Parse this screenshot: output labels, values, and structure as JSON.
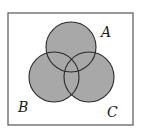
{
  "diagram": {
    "type": "venn",
    "title": "",
    "universe": {
      "x": 8,
      "y": 13,
      "width": 125,
      "height": 112,
      "stroke": "#555555"
    },
    "style": {
      "fill": "#a8a8a8",
      "stroke": "#2a2a2a",
      "shaded_region": "A ∪ B ∪ C"
    },
    "sets": [
      {
        "id": "A",
        "label": "A",
        "cx": 71,
        "cy": 47,
        "r": 25,
        "label_x": 101,
        "label_y": 37
      },
      {
        "id": "B",
        "label": "B",
        "cx": 54,
        "cy": 77,
        "r": 25,
        "label_x": 18,
        "label_y": 112
      },
      {
        "id": "C",
        "label": "C",
        "cx": 89,
        "cy": 77,
        "r": 25,
        "label_x": 107,
        "label_y": 117
      }
    ]
  }
}
